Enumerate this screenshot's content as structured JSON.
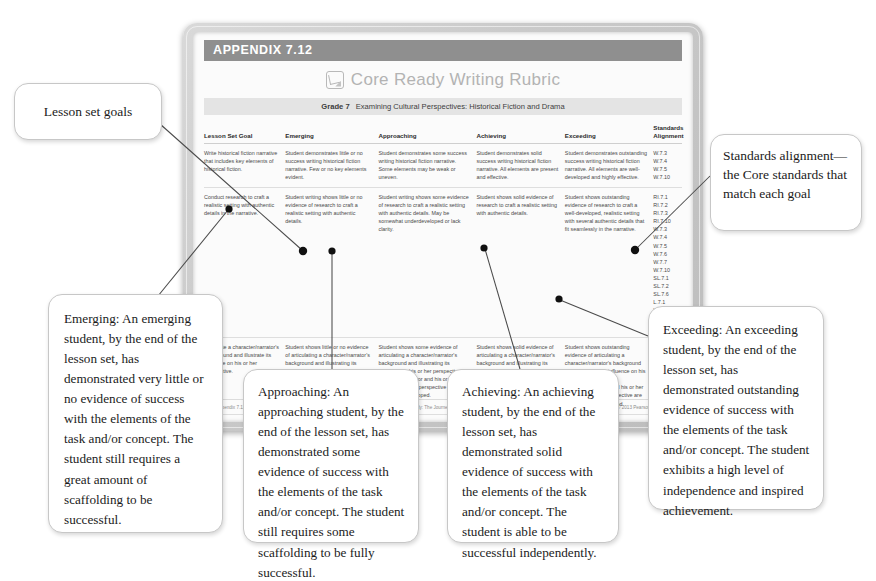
{
  "document": {
    "appendix_label": "APPENDIX 7.12",
    "rubric_title": "Core Ready Writing Rubric",
    "logo_icon": "checklist-square-icon",
    "grade_label": "Grade 7",
    "grade_subject": "Examining Cultural Perspectives: Historical Fiction and Drama",
    "footer_left": "Appendix 7.12",
    "footer_center": "Core Ready: The Journey Begins",
    "footer_right": "© 2013 Pearson Education, Inc.",
    "footer_badge": "p"
  },
  "table": {
    "headers": [
      "Lesson Set Goal",
      "Emerging",
      "Approaching",
      "Achieving",
      "Exceeding",
      "Standards Alignment"
    ],
    "rows": [
      {
        "goal": "Write historical fiction narrative that includes key elements of historical fiction.",
        "emerging": "Student demonstrates little or no success writing historical fiction narrative. Few or no key elements evident.",
        "approaching": "Student demonstrates some success writing historical fiction narrative. Some elements may be weak or uneven.",
        "achieving": "Student demonstrates solid success writing historical fiction narrative. All elements are present and effective.",
        "exceeding": "Student demonstrates outstanding success writing historical fiction narrative. All elements are well-developed and highly effective.",
        "standards": [
          "W.7.3",
          "W.7.4",
          "W.7.5",
          "W.7.10"
        ]
      },
      {
        "goal": "Conduct research to craft a realistic setting with authentic details in the narrative.",
        "emerging": "Student writing shows little or no evidence of research to craft a realistic setting with authentic details.",
        "approaching": "Student writing shows some evidence of research to craft a realistic setting with authentic details. May be somewhat underdeveloped or lack clarity.",
        "achieving": "Student shows solid evidence of research to craft a realistic setting with authentic details.",
        "exceeding": "Student shows outstanding evidence of research to craft a well-developed, realistic setting with several authentic details that fit seamlessly in the narrative.",
        "standards": [
          "RI.7.1",
          "RI.7.2",
          "RI.7.3",
          "RI.7.10",
          "W.7.3",
          "W.7.4",
          "W.7.5",
          "W.7.6",
          "W.7.7",
          "W.7.10",
          "SL.7.1",
          "SL.7.2",
          "SL.7.6",
          "L.7.1",
          "L.7.2",
          "L.7.3",
          "L.7.6"
        ]
      },
      {
        "goal": "Articulate a character/narrator's background and illustrate its influence on his or her perspective.",
        "emerging": "Student shows little or no evidence of articulating a character/narrator's background and illustrating its influence on his or her perspective. Character/narrator and his or her background and perspective are underdeveloped.",
        "approaching": "Student shows some evidence of articulating a character/narrator's background and illustrating its influence on his or her perspective. Character/narrator and his or her background and perspective are somewhat developed.",
        "achieving": "Student shows solid evidence of articulating a character/narrator's background and illustrating its influence on his or her perspective. Character/narrator and his or her background and perspective are well developed.",
        "exceeding": "Student shows outstanding evidence of articulating a character/narrator's background and illustrating its influence on his or her perspective. Character/narrator and his or her background and perspective are exceptionally developed.",
        "standards": [
          "W.7.3",
          "W.7.4",
          "W.7.5",
          "W.7.10"
        ]
      }
    ]
  },
  "callouts": {
    "lesson_goals": "Lesson set goals",
    "standards_alignment": "Standards alignment—the Core standards that match each goal",
    "emerging": "Emerging: An emerging student, by the end of the lesson set, has demonstrated very little or no evidence of success with the elements of the task and/or concept. The student still requires a great amount of scaffolding to be successful.",
    "approaching": "Approaching: An approaching student, by the end of the lesson set, has demonstrated some evidence of success with the elements of the task and/or concept. The student still requires some scaffolding to be fully successful.",
    "achieving": "Achieving: An achieving student, by the end of the lesson set, has demonstrated solid evidence of success with the elements of the task and/or concept. The student is able to be successful independently.",
    "exceeding": "Exceeding: An exceeding student, by the end of the lesson set, has demonstrated outstanding evidence of success with the elements of the task and/or concept. The student exhibits a high level of independence and inspired achievement."
  },
  "colors": {
    "appendix_bar": "#8f8f8f",
    "grade_band": "#e4e4e4",
    "title_gray": "#b3b3b3",
    "device_frame": "#c9c9c9",
    "callout_border": "#c7c7c7"
  }
}
